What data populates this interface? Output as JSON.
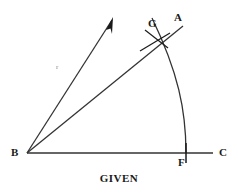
{
  "figure": {
    "title": "GIVEN",
    "background_color": "#ffffff",
    "stroke_color": "#333333",
    "label_color": "#1a1a1a",
    "points": {
      "B": {
        "label": "B",
        "x": 27,
        "y": 153,
        "label_x": 13,
        "label_y": 148
      },
      "C": {
        "label": "C",
        "x": 212,
        "y": 153,
        "label_x": 219,
        "label_y": 148
      },
      "F": {
        "label": "F",
        "x": 186,
        "y": 153,
        "label_x": 179,
        "label_y": 158
      },
      "G": {
        "label": "G",
        "x": 156,
        "y": 40,
        "label_x": 149,
        "label_y": 19
      },
      "A": {
        "label": "A",
        "x": 182,
        "y": 24,
        "label_x": 175,
        "label_y": 13
      }
    },
    "ray_mark": {
      "label": "r",
      "x": 58,
      "y": 66
    },
    "segments": [
      {
        "name": "baseline-bc",
        "from": "B",
        "to": "C"
      },
      {
        "name": "ray-ba",
        "from": "B",
        "to": "A"
      },
      {
        "name": "ray-b-arrow",
        "from": "B",
        "to": "arrow-tip"
      }
    ],
    "arc": {
      "name": "arc-from-f-through-g",
      "center": "B",
      "start": "F",
      "end": "arc-top"
    },
    "tick_marks": [
      "f-tick",
      "g-cross-mark-1",
      "g-cross-mark-2"
    ],
    "arrow": {
      "name": "ray-arrowhead",
      "tip_x": 113,
      "tip_y": 17
    }
  }
}
